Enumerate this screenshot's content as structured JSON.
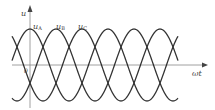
{
  "diagram": {
    "axes": {
      "y_label": "u",
      "x_label": "ωt",
      "origin_label": "0"
    },
    "series": [
      {
        "name": "uA",
        "label_main": "u",
        "label_sub": "A",
        "phase_deg": 0
      },
      {
        "name": "uB",
        "label_main": "u",
        "label_sub": "B",
        "phase_deg": -120
      },
      {
        "name": "uC",
        "label_main": "u",
        "label_sub": "C",
        "phase_deg": 120
      }
    ],
    "colors": {
      "curve": "#333333",
      "axis": "#777777"
    }
  }
}
